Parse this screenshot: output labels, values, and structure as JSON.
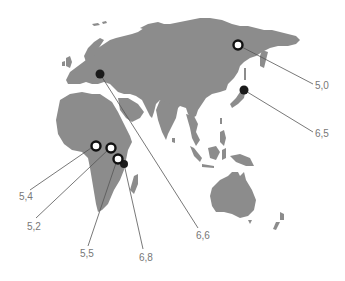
{
  "map": {
    "region": "Europe, Africa, Asia and Oceania",
    "colors": {
      "land": "#8c8c8c",
      "background": "#ffffff",
      "marker": "#111111",
      "label": "#777777"
    },
    "legend_types": {
      "open": "ring marker",
      "solid": "filled marker"
    },
    "markers": [
      {
        "id": "m1",
        "type": "open",
        "value": "5,0",
        "location": "Eastern Siberia"
      },
      {
        "id": "m2",
        "type": "solid",
        "value": "6,5",
        "location": "Japan"
      },
      {
        "id": "m3",
        "type": "solid",
        "value": "6,6",
        "location": "Central Europe"
      },
      {
        "id": "m4",
        "type": "open",
        "value": "5,4",
        "location": "Central Africa (west)"
      },
      {
        "id": "m5",
        "type": "open",
        "value": "5,2",
        "location": "Central Africa (east)"
      },
      {
        "id": "m6",
        "type": "open",
        "value": "5,5",
        "location": "East Africa"
      },
      {
        "id": "m7",
        "type": "solid",
        "value": "6,8",
        "location": "East Africa"
      }
    ]
  }
}
